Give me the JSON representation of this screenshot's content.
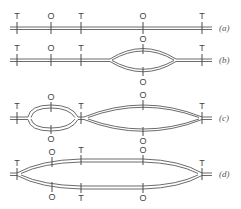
{
  "figure": {
    "marker_types": {
      "T": "T",
      "O": "O"
    },
    "rows": [
      {
        "id": "a",
        "label": "(a)",
        "description": "Unreplicated linear duplex",
        "markers": [
          {
            "type": "T",
            "x": 17
          },
          {
            "type": "O",
            "x": 51
          },
          {
            "type": "T",
            "x": 81
          },
          {
            "type": "O",
            "x": 143
          },
          {
            "type": "T",
            "x": 202
          }
        ]
      },
      {
        "id": "b",
        "label": "(b)",
        "description": "Single replication bubble opened at second origin",
        "markers_line": [
          {
            "type": "T",
            "x": 17
          },
          {
            "type": "O",
            "x": 51
          },
          {
            "type": "T",
            "x": 81
          },
          {
            "type": "T",
            "x": 202
          }
        ],
        "bubble": {
          "x1": 110,
          "x2": 176,
          "markers": [
            {
              "type": "O",
              "x": 142,
              "side": "top"
            },
            {
              "type": "O",
              "x": 142,
              "side": "bottom"
            }
          ]
        }
      },
      {
        "id": "c",
        "label": "(c)",
        "description": "Two bubbles; larger bubble reached terminator",
        "markers_line": [
          {
            "type": "T",
            "x": 17
          },
          {
            "type": "T",
            "x": 81
          }
        ],
        "bubbles": [
          {
            "x1": 28,
            "x2": 78,
            "markers": [
              {
                "type": "O",
                "x": 51,
                "side": "top"
              },
              {
                "type": "O",
                "x": 51,
                "side": "bottom"
              }
            ]
          },
          {
            "x1": 82,
            "x2": 202,
            "markers": [
              {
                "type": "O",
                "x": 143,
                "side": "top"
              },
              {
                "type": "O",
                "x": 143,
                "side": "bottom"
              },
              {
                "type": "T",
                "x": 202,
                "side": "end"
              }
            ]
          }
        ]
      },
      {
        "id": "d",
        "label": "(d)",
        "description": "Bubbles fused into one spanning terminators",
        "markers_line": [
          {
            "type": "T",
            "x": 17
          },
          {
            "type": "T",
            "x": 202
          }
        ],
        "bubble": {
          "x1": 17,
          "x2": 202,
          "markers": [
            {
              "type": "O",
              "x": 51,
              "side": "top"
            },
            {
              "type": "T",
              "x": 81,
              "side": "top"
            },
            {
              "type": "O",
              "x": 143,
              "side": "top"
            },
            {
              "type": "O",
              "x": 51,
              "side": "bottom"
            },
            {
              "type": "T",
              "x": 81,
              "side": "bottom"
            },
            {
              "type": "O",
              "x": 143,
              "side": "bottom"
            }
          ]
        }
      }
    ]
  }
}
